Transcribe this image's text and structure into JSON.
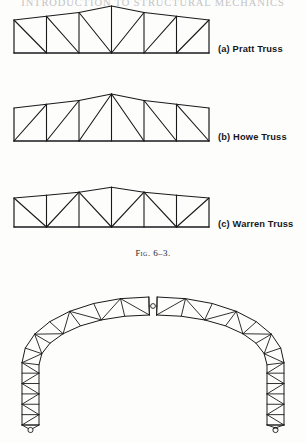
{
  "page": {
    "running_head": "INTRODUCTION TO STRUCTURAL MECHANICS",
    "background_color": "#fdfdfc",
    "ink_color": "#17171a"
  },
  "figure": {
    "caption_prefix": "Fig.",
    "caption_number": "6–3.",
    "caption_full": "Fig. 6–3."
  },
  "trusses": [
    {
      "id": "pratt",
      "label": "(a) Pratt Truss",
      "label_letter": "(a)",
      "label_name": "Pratt Truss",
      "type": "parallel-chord-pitched",
      "panels": 6,
      "span_px": 195,
      "diagonal_direction": "toward-center-down",
      "geometry": {
        "x0": 14,
        "x1": 209,
        "y_bottom": 53,
        "y_eave": 20,
        "y_apex": 6,
        "panel_x": [
          14,
          46.5,
          79,
          111.5,
          144,
          176.5,
          209
        ],
        "top_y": [
          20,
          16.3,
          12.5,
          6,
          12.5,
          16.3,
          20
        ],
        "verticals_x": [
          46.5,
          79,
          111.5,
          144,
          176.5
        ],
        "diagonals": [
          {
            "x1": 14,
            "y1": 20,
            "x2": 46.5,
            "y2": 53
          },
          {
            "x1": 46.5,
            "y1": 16.3,
            "x2": 79,
            "y2": 53
          },
          {
            "x1": 79,
            "y1": 12.5,
            "x2": 111.5,
            "y2": 53
          },
          {
            "x1": 144,
            "y1": 12.5,
            "x2": 111.5,
            "y2": 53
          },
          {
            "x1": 176.5,
            "y1": 16.3,
            "x2": 144,
            "y2": 53
          },
          {
            "x1": 209,
            "y1": 20,
            "x2": 176.5,
            "y2": 53
          }
        ]
      },
      "label_pos": {
        "x": 218,
        "y": 44
      }
    },
    {
      "id": "howe",
      "label": "(b) Howe Truss",
      "label_letter": "(b)",
      "label_name": "Howe Truss",
      "type": "parallel-chord-pitched",
      "panels": 6,
      "span_px": 195,
      "diagonal_direction": "away-from-center-down",
      "geometry": {
        "x0": 14,
        "x1": 209,
        "y_bottom": 141,
        "y_eave": 108,
        "y_apex": 94,
        "panel_x": [
          14,
          46.5,
          79,
          111.5,
          144,
          176.5,
          209
        ],
        "top_y": [
          108,
          104.3,
          100.5,
          94,
          100.5,
          104.3,
          108
        ],
        "verticals_x": [
          46.5,
          79,
          111.5,
          144,
          176.5
        ],
        "diagonals": [
          {
            "x1": 46.5,
            "y1": 104.3,
            "x2": 14,
            "y2": 141
          },
          {
            "x1": 79,
            "y1": 100.5,
            "x2": 46.5,
            "y2": 141
          },
          {
            "x1": 111.5,
            "y1": 94,
            "x2": 79,
            "y2": 141
          },
          {
            "x1": 111.5,
            "y1": 94,
            "x2": 144,
            "y2": 141
          },
          {
            "x1": 144,
            "y1": 100.5,
            "x2": 176.5,
            "y2": 141
          },
          {
            "x1": 176.5,
            "y1": 104.3,
            "x2": 209,
            "y2": 141
          }
        ]
      },
      "label_pos": {
        "x": 218,
        "y": 132
      }
    },
    {
      "id": "warren",
      "label": "(c) Warren Truss",
      "label_letter": "(c)",
      "label_name": "Warren Truss",
      "type": "parallel-chord-pitched",
      "panels": 6,
      "span_px": 195,
      "diagonal_direction": "alternating-zigzag",
      "geometry": {
        "x0": 14,
        "x1": 209,
        "y_bottom": 227,
        "y_eave": 198,
        "y_apex": 187,
        "panel_x": [
          14,
          46.5,
          79,
          111.5,
          144,
          176.5,
          209
        ],
        "top_y": [
          198,
          195.2,
          192.2,
          187.2,
          192.2,
          195.2,
          198
        ],
        "verticals_x": [
          46.5,
          79,
          111.5,
          144,
          176.5
        ],
        "diagonals": [
          {
            "x1": 14,
            "y1": 198,
            "x2": 46.5,
            "y2": 227
          },
          {
            "x1": 79,
            "y1": 192.2,
            "x2": 46.5,
            "y2": 227
          },
          {
            "x1": 79,
            "y1": 192.2,
            "x2": 111.5,
            "y2": 227
          },
          {
            "x1": 144,
            "y1": 192.2,
            "x2": 111.5,
            "y2": 227
          },
          {
            "x1": 144,
            "y1": 192.2,
            "x2": 176.5,
            "y2": 227
          },
          {
            "x1": 209,
            "y1": 198,
            "x2": 176.5,
            "y2": 227
          }
        ]
      },
      "label_pos": {
        "x": 218,
        "y": 219
      }
    }
  ],
  "arch": {
    "id": "three-hinged-arch-truss",
    "type": "three-hinged-arch-truss",
    "description": "Three-hinged arch truss with pin supports at the springings and a crown hinge",
    "hinges": {
      "crown": {
        "x": 153,
        "y": 300
      },
      "left_support": {
        "x": 22,
        "y": 436
      },
      "right_support": {
        "x": 284,
        "y": 436
      }
    },
    "panels_per_half": 13,
    "outer_chord": [
      [
        17,
        436
      ],
      [
        17,
        400
      ],
      [
        17,
        364
      ],
      [
        17,
        330
      ],
      [
        20,
        300
      ],
      [
        27,
        276
      ],
      [
        39,
        256
      ],
      [
        56,
        238
      ],
      [
        77,
        224
      ],
      [
        100,
        213
      ],
      [
        124,
        206
      ],
      [
        146,
        202
      ],
      [
        150,
        296
      ]
    ],
    "inner_chord": [
      [
        34,
        436
      ],
      [
        34,
        400
      ],
      [
        34,
        364
      ],
      [
        35,
        333
      ],
      [
        39,
        310
      ],
      [
        48,
        292
      ],
      [
        62,
        277
      ],
      [
        80,
        265
      ],
      [
        101,
        256
      ],
      [
        124,
        250
      ],
      [
        148,
        246
      ],
      [
        152,
        302
      ]
    ],
    "stroke_width": 0.9
  },
  "colors": {
    "ink": "#17171a",
    "line": "#1a1a1c",
    "paper": "#fdfdfc",
    "running_head": "#b9b9bb"
  }
}
